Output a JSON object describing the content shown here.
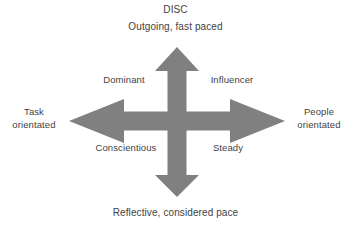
{
  "diagram": {
    "name": "DISC model four-quadrant cross arrow diagram",
    "background_color": "#ffffff",
    "arrow_color": "#808080",
    "text_color": "#3f3f3f",
    "title": "DISC",
    "axes": {
      "top_label": "Outgoing, fast paced",
      "bottom_label": "Reflective, considered pace",
      "left_label_line1": "Task",
      "left_label_line2": "orientated",
      "right_label_line1": "People",
      "right_label_line2": "orientated"
    },
    "quadrants": {
      "top_left": "Dominant",
      "top_right": "Influencer",
      "bottom_left": "Conscientious",
      "bottom_right": "Steady"
    },
    "icons": {
      "cross_arrow": "four-headed-cross-arrow-icon"
    }
  }
}
